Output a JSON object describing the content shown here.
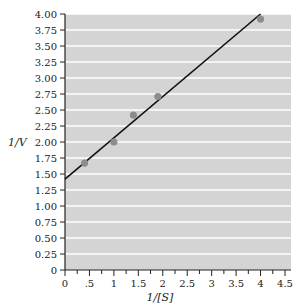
{
  "chart_data": {
    "type": "scatter",
    "title": "",
    "xlabel": "1/[S]",
    "ylabel": "1/V",
    "xlim": [
      0,
      4.5
    ],
    "ylim": [
      0,
      4.0
    ],
    "x_ticks": [
      "0",
      ".5",
      "1",
      "1.5",
      "2",
      "2.5",
      "3",
      "3.5",
      "4",
      "4.5"
    ],
    "y_ticks": [
      "0",
      "0.25",
      "0.50",
      "0.75",
      "1.00",
      "1.25",
      "1.50",
      "1.75",
      "2.00",
      "2.25",
      "2.50",
      "2.75",
      "3.00",
      "3.25",
      "3.50",
      "3.75",
      "4.00"
    ],
    "grid": "horizontal white lines on gray background",
    "legend": "none",
    "series": [
      {
        "name": "data points",
        "kind": "scatter",
        "x": [
          0.4,
          1.0,
          1.4,
          1.9,
          4.0
        ],
        "y": [
          1.67,
          2.0,
          2.42,
          2.71,
          3.92
        ]
      },
      {
        "name": "linear fit",
        "kind": "line",
        "x": [
          0,
          4.0
        ],
        "y": [
          1.42,
          4.0
        ]
      }
    ],
    "colors": {
      "plot_bg": "#d4d4d4",
      "grid": "#ffffff",
      "points": "#8c8c8c",
      "line": "#111111"
    }
  }
}
